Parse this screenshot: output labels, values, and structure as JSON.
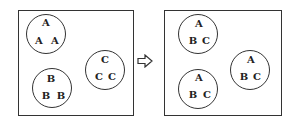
{
  "diagram": {
    "arrow_icon": "right-hollow-arrow",
    "left_panel": {
      "circles": [
        {
          "cx": 46,
          "cy": 34,
          "r": 20,
          "labels": [
            "A",
            "A",
            "A"
          ]
        },
        {
          "cx": 52,
          "cy": 91,
          "r": 20,
          "labels": [
            "B",
            "B",
            "B"
          ]
        },
        {
          "cx": 104,
          "cy": 70,
          "r": 20,
          "labels": [
            "C",
            "C",
            "C"
          ]
        }
      ]
    },
    "right_panel": {
      "circles": [
        {
          "cx": 197,
          "cy": 34,
          "r": 20,
          "labels": [
            "A",
            "B",
            "C"
          ]
        },
        {
          "cx": 198,
          "cy": 91,
          "r": 20,
          "labels": [
            "A",
            "B",
            "C"
          ]
        },
        {
          "cx": 250,
          "cy": 70,
          "r": 20,
          "labels": [
            "A",
            "B",
            "C"
          ]
        }
      ]
    }
  }
}
